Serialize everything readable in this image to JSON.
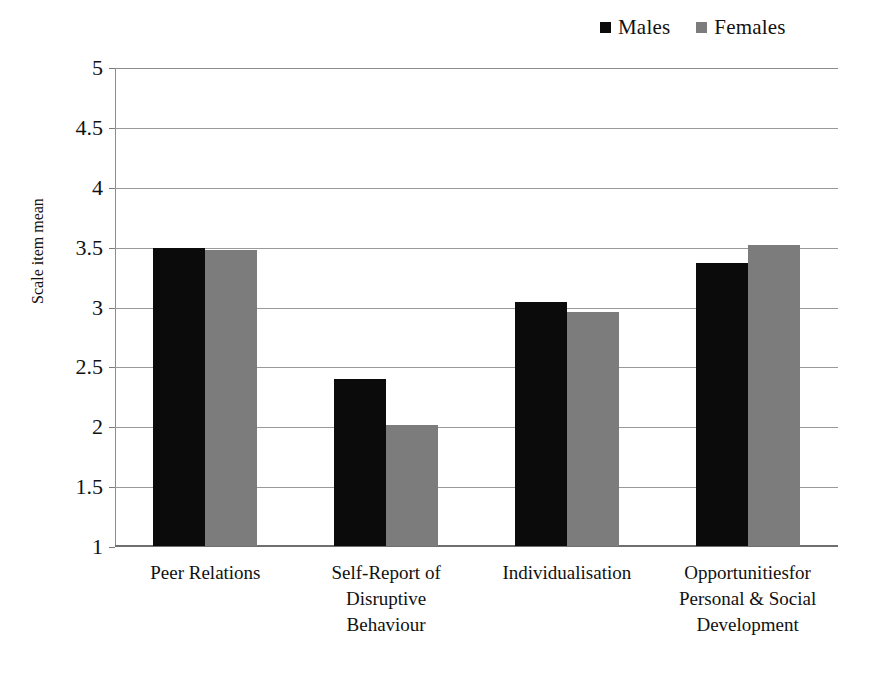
{
  "chart_data": {
    "type": "bar",
    "title": "",
    "xlabel": "",
    "ylabel": "Scale item mean",
    "ylim": [
      1,
      5
    ],
    "yticks": [
      "1",
      "1.5",
      "2",
      "2.5",
      "3",
      "3.5",
      "4",
      "4.5",
      "5"
    ],
    "ytick_values": [
      1,
      1.5,
      2,
      2.5,
      3,
      3.5,
      4,
      4.5,
      5
    ],
    "grid": "horizontal",
    "legend_position": "top-right",
    "categories": [
      "Peer Relations",
      "Self-Report  of\nDisruptive\nBehaviour",
      "Individualisation",
      "Opportunitiesfor\nPersonal & Social\nDevelopment"
    ],
    "series": [
      {
        "name": "Males",
        "color": "#0b0b0b",
        "values": [
          3.5,
          2.4,
          3.05,
          3.37
        ]
      },
      {
        "name": "Females",
        "color": "#7c7c7c",
        "values": [
          3.48,
          2.02,
          2.96,
          3.52
        ]
      }
    ]
  },
  "legend": {
    "entries": [
      {
        "label": "Males",
        "swatch": "black-square-icon"
      },
      {
        "label": "Females",
        "swatch": "gray-square-icon"
      }
    ]
  },
  "axes": {
    "y_title": "Scale item mean",
    "y_tick_labels": [
      "5",
      "4.5",
      "4",
      "3.5",
      "3",
      "2.5",
      "2",
      "1.5",
      "1"
    ]
  },
  "categories_display": [
    {
      "lines": [
        "Peer Relations"
      ]
    },
    {
      "lines": [
        "Self-Report  of",
        "Disruptive",
        "Behaviour"
      ]
    },
    {
      "lines": [
        "Individualisation"
      ]
    },
    {
      "lines": [
        "Opportunitiesfor",
        "Personal & Social",
        "Development"
      ]
    }
  ]
}
